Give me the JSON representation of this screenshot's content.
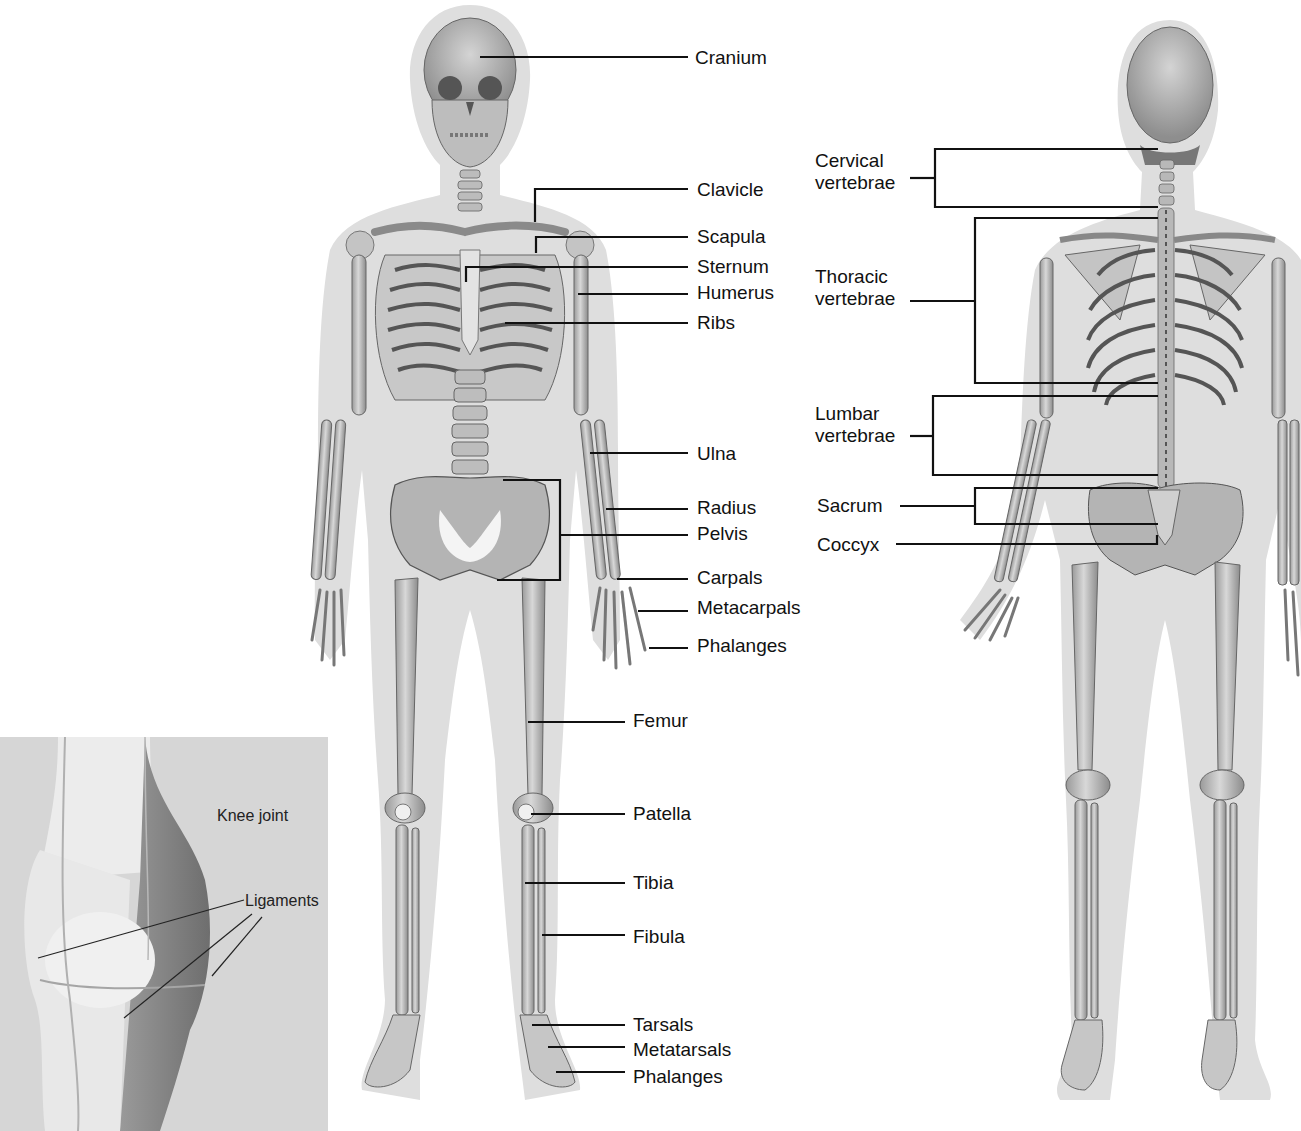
{
  "colors": {
    "background": "#ffffff",
    "body_silhouette": "#dcdcdc",
    "bone_fill": "#c9c9c9",
    "bone_dark": "#8a8a8a",
    "bone_outline": "#555555",
    "leader_line": "#111111",
    "inset_bg": "#d6d6d6",
    "text": "#111111"
  },
  "front_view": {
    "labels": [
      {
        "text": "Cranium",
        "x": 695,
        "y": 47,
        "line": [
          [
            480,
            57
          ],
          [
            688,
            57
          ]
        ]
      },
      {
        "text": "Clavicle",
        "x": 697,
        "y": 179,
        "line": [
          [
            535,
            222
          ],
          [
            535,
            189
          ],
          [
            688,
            189
          ]
        ]
      },
      {
        "text": "Scapula",
        "x": 697,
        "y": 226,
        "line": [
          [
            536,
            253
          ],
          [
            536,
            237
          ],
          [
            688,
            237
          ]
        ]
      },
      {
        "text": "Sternum",
        "x": 697,
        "y": 256,
        "line": [
          [
            466,
            282
          ],
          [
            466,
            267
          ],
          [
            688,
            267
          ]
        ]
      },
      {
        "text": "Humerus",
        "x": 697,
        "y": 282,
        "line": [
          [
            578,
            294
          ],
          [
            688,
            294
          ]
        ]
      },
      {
        "text": "Ribs",
        "x": 697,
        "y": 312,
        "line": [
          [
            505,
            323
          ],
          [
            688,
            323
          ]
        ]
      },
      {
        "text": "Ulna",
        "x": 697,
        "y": 443,
        "line": [
          [
            590,
            453
          ],
          [
            688,
            453
          ]
        ]
      },
      {
        "text": "Radius",
        "x": 697,
        "y": 497,
        "line": [
          [
            606,
            509
          ],
          [
            688,
            509
          ]
        ]
      },
      {
        "text": "Pelvis",
        "x": 697,
        "y": 523,
        "line": [
          [
            560,
            535
          ],
          [
            688,
            535
          ]
        ]
      },
      {
        "text": "Carpals",
        "x": 697,
        "y": 567,
        "line": [
          [
            617,
            579
          ],
          [
            688,
            579
          ]
        ]
      },
      {
        "text": "Metacarpals",
        "x": 697,
        "y": 597,
        "line": [
          [
            638,
            611
          ],
          [
            688,
            611
          ]
        ]
      },
      {
        "text": "Phalanges",
        "x": 697,
        "y": 635,
        "line": [
          [
            649,
            648
          ],
          [
            688,
            648
          ]
        ]
      },
      {
        "text": "Femur",
        "x": 633,
        "y": 710,
        "line": [
          [
            528,
            722
          ],
          [
            625,
            722
          ]
        ]
      },
      {
        "text": "Patella",
        "x": 633,
        "y": 803,
        "line": [
          [
            531,
            814
          ],
          [
            625,
            814
          ]
        ]
      },
      {
        "text": "Tibia",
        "x": 633,
        "y": 872,
        "line": [
          [
            525,
            883
          ],
          [
            625,
            883
          ]
        ]
      },
      {
        "text": "Fibula",
        "x": 633,
        "y": 926,
        "line": [
          [
            542,
            935
          ],
          [
            625,
            935
          ]
        ]
      },
      {
        "text": "Tarsals",
        "x": 633,
        "y": 1014,
        "line": [
          [
            532,
            1025
          ],
          [
            625,
            1025
          ]
        ]
      },
      {
        "text": "Metatarsals",
        "x": 633,
        "y": 1039,
        "line": [
          [
            548,
            1047
          ],
          [
            625,
            1047
          ]
        ]
      },
      {
        "text": "Phalanges",
        "x": 633,
        "y": 1066,
        "line": [
          [
            556,
            1072
          ],
          [
            625,
            1072
          ]
        ]
      }
    ],
    "pelvis_bracket": [
      [
        503,
        480
      ],
      [
        560,
        480
      ],
      [
        560,
        580
      ],
      [
        497,
        580
      ]
    ]
  },
  "back_view": {
    "labels": [
      {
        "text": [
          "Cervical",
          "vertebrae"
        ],
        "x": 815,
        "y": 150,
        "bracket": {
          "x": 935,
          "top": 149,
          "bottom": 207,
          "right": 1158,
          "stem_from": 910
        }
      },
      {
        "text": [
          "Thoracic",
          "vertebrae"
        ],
        "x": 815,
        "y": 266,
        "bracket": {
          "x": 975,
          "top": 218,
          "bottom": 383,
          "right": 1158,
          "stem_from": 910
        }
      },
      {
        "text": [
          "Lumbar",
          "vertebrae"
        ],
        "x": 815,
        "y": 403,
        "bracket": {
          "x": 933,
          "top": 396,
          "bottom": 475,
          "right": 1158,
          "stem_from": 910
        }
      },
      {
        "text": [
          "Sacrum"
        ],
        "x": 817,
        "y": 495,
        "bracket": {
          "x": 975,
          "top": 488,
          "bottom": 524,
          "right": 1158,
          "stem_from": 900
        }
      },
      {
        "text": [
          "Coccyx"
        ],
        "x": 817,
        "y": 534,
        "line": [
          [
            896,
            544
          ],
          [
            1157,
            544
          ],
          [
            1157,
            535
          ]
        ]
      }
    ]
  },
  "knee_inset": {
    "title": "Knee joint",
    "ligaments_label": "Ligaments",
    "box": {
      "x": 0,
      "y": 737,
      "w": 328,
      "h": 394
    }
  }
}
